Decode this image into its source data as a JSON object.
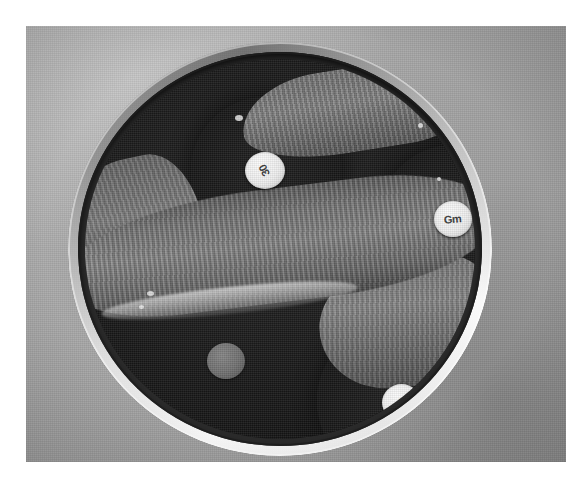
{
  "image": {
    "kind": "photograph",
    "subject": "Petri dish antibiotic disk diffusion susceptibility test",
    "palette": "grayscale",
    "caption": "",
    "background_color": "#a6a6a6",
    "print_border_color": "#ffffff",
    "agar_color": "#1a1a1a",
    "lawn_color": "#7d7d7d",
    "disk_color": "#f2f2f2",
    "rim_highlight_color": "#ffffff"
  },
  "plate": {
    "label": "petri-dish",
    "rim_label": "dish-rim",
    "agar_label": "agar-surface"
  },
  "growth": {
    "main_streak_label": "bacterial-streak-band",
    "upper_patch_label": "bacterial-growth-upper",
    "right_patch_label": "bacterial-growth-right",
    "left_patch_label": "bacterial-growth-left",
    "gloss_label": "agar-surface-highlight"
  },
  "disks": [
    {
      "id": "top",
      "label": "30",
      "antibiotic": "",
      "zone": "inhibition-zone-top"
    },
    {
      "id": "right",
      "label": "Gm",
      "antibiotic": "Gentamicin",
      "zone": "inhibition-zone-right"
    },
    {
      "id": "bottom",
      "label": "S",
      "antibiotic": "",
      "zone": "inhibition-zone-bottom"
    },
    {
      "id": "buried",
      "label": "",
      "antibiotic": "",
      "zone": ""
    }
  ]
}
